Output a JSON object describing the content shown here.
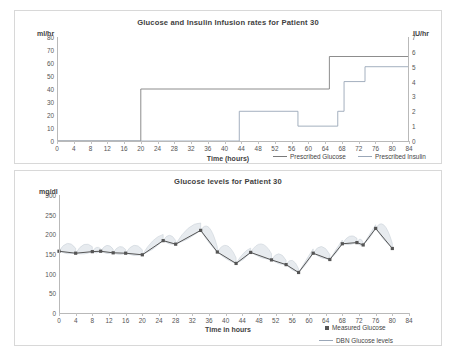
{
  "chart_data": [
    {
      "type": "line",
      "title": "Glucose and Insulin  Infusion rates for Patient 30",
      "xlabel": "Time (hours)",
      "ylabel": "ml/hr",
      "ylabel_right": "IU/hr",
      "xlim": [
        0,
        84
      ],
      "ylim": [
        0,
        80
      ],
      "ylim_right": [
        0,
        7
      ],
      "xticks": [
        0,
        4,
        8,
        12,
        16,
        20,
        24,
        28,
        32,
        36,
        40,
        44,
        48,
        52,
        56,
        60,
        64,
        68,
        72,
        76,
        80,
        84
      ],
      "yticks": [
        0,
        10,
        20,
        30,
        40,
        50,
        60,
        70,
        80
      ],
      "yticks_right": [
        0,
        1,
        2,
        3,
        4,
        5,
        6,
        7
      ],
      "grid": false,
      "legend_position": "bottom-right",
      "series": [
        {
          "name": "Prescribed Glucose",
          "axis": "left",
          "color": "#808080",
          "step": "post",
          "x": [
            0,
            20,
            20,
            65,
            65,
            84
          ],
          "y": [
            0,
            0,
            40,
            40,
            65,
            65
          ]
        },
        {
          "name": "Prescribed Insulin",
          "axis": "right",
          "color": "#9aa7b8",
          "step": "post",
          "x": [
            0,
            43.5,
            43.5,
            57.5,
            57.5,
            67,
            67,
            68.5,
            68.5,
            73.5,
            73.5,
            84
          ],
          "y": [
            0,
            0,
            2,
            2,
            1,
            1,
            2,
            2,
            4,
            4,
            5,
            5
          ],
          "y_right_units": [
            0,
            0,
            2,
            2,
            1,
            1,
            2,
            2,
            4,
            4,
            5,
            5
          ]
        }
      ]
    },
    {
      "type": "line",
      "title": "Glucose levels for Patient 30",
      "xlabel": "Time in hours",
      "ylabel": "mg/dl",
      "xlim": [
        0,
        84
      ],
      "ylim": [
        0,
        300
      ],
      "xticks": [
        0,
        4,
        8,
        12,
        16,
        20,
        24,
        28,
        32,
        36,
        40,
        44,
        48,
        52,
        56,
        60,
        64,
        68,
        72,
        76,
        80,
        84
      ],
      "yticks": [
        0,
        50,
        100,
        150,
        200,
        250,
        300
      ],
      "grid": false,
      "legend_position": "bottom-right",
      "series": [
        {
          "name": "Measured Glucose",
          "marker": "square",
          "color": "#555555",
          "x": [
            0,
            4,
            8,
            10,
            13,
            16,
            20,
            25,
            28,
            34,
            38,
            42.5,
            46,
            51,
            54.5,
            57.5,
            61,
            65,
            68,
            71.5,
            73,
            76,
            80
          ],
          "y": [
            157,
            152,
            156,
            157,
            153,
            152,
            148,
            184,
            175,
            210,
            155,
            126,
            154,
            135,
            123,
            103,
            152,
            136,
            176,
            179,
            173,
            215,
            164
          ]
        },
        {
          "name": "DBN Glucose levels",
          "color": "#b9c2cc",
          "description": "Model band envelope following measured glucose trajectory"
        }
      ]
    }
  ],
  "top_chart": {
    "title": "Glucose and Insulin  Infusion rates for Patient 30",
    "unit_left": "ml/hr",
    "unit_right": "IU/hr",
    "xlabel": "Time (hours)",
    "legend": [
      {
        "label": "Prescribed Glucose"
      },
      {
        "label": "Prescribed Insulin"
      }
    ]
  },
  "bottom_chart": {
    "title": "Glucose levels for Patient 30",
    "unit_left": "mg/dl",
    "xlabel": "Time in hours",
    "legend": [
      {
        "label": "Measured Glucose"
      },
      {
        "label": "DBN Glucose levels"
      }
    ]
  }
}
